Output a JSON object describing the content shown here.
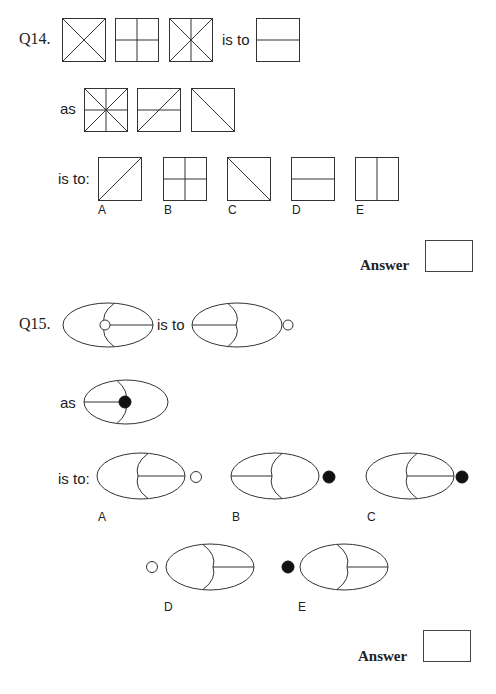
{
  "q14": {
    "number": "Q14.",
    "is_to": "is to",
    "as": "as",
    "is_to_colon": "is to:",
    "stem_row1": [
      "square with both diagonals",
      "square divided into four quadrants",
      "square with both diagonals and vertical line",
      "is to",
      "square with horizontal midline"
    ],
    "stem_row2": [
      "square with both diagonals, vertical and horizontal lines",
      "square with horizontal midline and rising diagonal",
      "square with falling diagonal"
    ],
    "options": [
      {
        "label": "A",
        "figure": "square with rising diagonal"
      },
      {
        "label": "B",
        "figure": "square divided into four quadrants"
      },
      {
        "label": "C",
        "figure": "square with falling diagonal"
      },
      {
        "label": "D",
        "figure": "square with horizontal midline"
      },
      {
        "label": "E",
        "figure": "square with vertical midline"
      }
    ],
    "answer_label": "Answer",
    "answer_value": ""
  },
  "q15": {
    "number": "Q15.",
    "is_to": "is to",
    "as": "as",
    "is_to_colon": "is to:",
    "options": [
      {
        "label": "A",
        "figure": "ellipse with right-side arc and line, white circle on right"
      },
      {
        "label": "B",
        "figure": "ellipse with left line to arc, black circle on right"
      },
      {
        "label": "C",
        "figure": "ellipse with right-side arc and line, black circle on right"
      },
      {
        "label": "D",
        "figure": "ellipse with left arc and right line, white circle on left"
      },
      {
        "label": "E",
        "figure": "ellipse with left arc and right line, black circle on left"
      }
    ],
    "answer_label": "Answer",
    "answer_value": ""
  }
}
